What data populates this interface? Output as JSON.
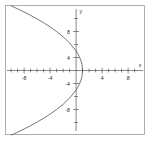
{
  "chart_data": {
    "type": "line",
    "title": "",
    "subtitle": "",
    "xlabel": "x",
    "ylabel": "y",
    "xlim": [
      -10.5,
      10.5
    ],
    "ylim": [
      -10.5,
      10.5
    ],
    "grid": false,
    "legend": null,
    "x_ticks": [
      -8,
      -4,
      4,
      8
    ],
    "x_tick_labels": [
      "-8",
      "-4",
      "4",
      "8"
    ],
    "x_minor_ticks": [
      -10,
      -9,
      -8,
      -7,
      -6,
      -5,
      -4,
      -3,
      -2,
      -1,
      1,
      2,
      3,
      4,
      5,
      6,
      7,
      8,
      9,
      10
    ],
    "y_ticks": [
      -8,
      -4,
      4,
      8
    ],
    "y_tick_labels": [
      "-8",
      "-4",
      "4",
      "8"
    ],
    "annotations": [],
    "series": [
      {
        "name": "parabola",
        "orientation": "opens-left",
        "vertex": [
          1,
          0
        ],
        "x_intercept": 1,
        "y_intercepts": [
          -3,
          3
        ],
        "equation": "x = 1 - y^2/9",
        "points": [
          [
            -10.0,
            -9.95
          ],
          [
            -9.0,
            -9.49
          ],
          [
            -8.0,
            -9.0
          ],
          [
            -7.0,
            -8.49
          ],
          [
            -6.0,
            -7.94
          ],
          [
            -5.0,
            -7.35
          ],
          [
            -4.0,
            -6.71
          ],
          [
            -3.0,
            -6.0
          ],
          [
            -2.0,
            -5.2
          ],
          [
            -1.0,
            -4.24
          ],
          [
            0.0,
            -3.0
          ],
          [
            0.25,
            -2.6
          ],
          [
            0.5,
            -2.12
          ],
          [
            0.75,
            -1.5
          ],
          [
            0.9,
            -0.95
          ],
          [
            1.0,
            0.0
          ],
          [
            0.9,
            0.95
          ],
          [
            0.75,
            1.5
          ],
          [
            0.5,
            2.12
          ],
          [
            0.25,
            2.6
          ],
          [
            0.0,
            3.0
          ],
          [
            -1.0,
            4.24
          ],
          [
            -2.0,
            5.2
          ],
          [
            -3.0,
            6.0
          ],
          [
            -4.0,
            6.71
          ],
          [
            -5.0,
            7.35
          ],
          [
            -6.0,
            7.94
          ],
          [
            -7.0,
            8.49
          ],
          [
            -8.0,
            9.0
          ],
          [
            -9.0,
            9.49
          ],
          [
            -10.0,
            9.95
          ]
        ]
      }
    ]
  },
  "axis_labels": {
    "x_axis_name": "x",
    "y_axis_name": "y"
  },
  "tick_text": {
    "x_neg8": "-8",
    "x_neg4": "-4",
    "x_pos4": "4",
    "x_pos8": "8",
    "y_neg8": "-8",
    "y_neg4": "-4",
    "y_pos4": "4",
    "y_pos8": "8"
  }
}
